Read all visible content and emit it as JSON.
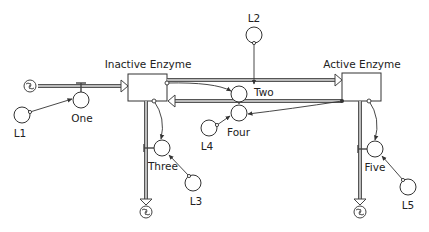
{
  "diagram": {
    "type": "stock-and-flow",
    "stocks": [
      {
        "id": "inactive",
        "label": "Inactive Enzyme"
      },
      {
        "id": "active",
        "label": "Active Enzyme"
      }
    ],
    "flows": [
      {
        "id": "one",
        "label": "One",
        "from": "source-cloud",
        "to": "inactive"
      },
      {
        "id": "two",
        "label": "Two",
        "from": "inactive",
        "to": "active"
      },
      {
        "id": "four",
        "label": "Four",
        "from": "active",
        "to": "inactive"
      },
      {
        "id": "three",
        "label": "Three",
        "from": "inactive",
        "to": "sink-cloud-1"
      },
      {
        "id": "five",
        "label": "Five",
        "from": "active",
        "to": "sink-cloud-2"
      }
    ],
    "converters": [
      {
        "id": "l1",
        "label": "L1",
        "links_to": "one"
      },
      {
        "id": "l2",
        "label": "L2",
        "links_to": "two"
      },
      {
        "id": "l3",
        "label": "L3",
        "links_to": "three"
      },
      {
        "id": "l4",
        "label": "L4",
        "links_to": "four"
      },
      {
        "id": "l5",
        "label": "L5",
        "links_to": "five"
      }
    ],
    "links": [
      {
        "from": "inactive",
        "to": "two"
      },
      {
        "from": "active",
        "to": "four"
      },
      {
        "from": "inactive",
        "to": "three"
      },
      {
        "from": "active",
        "to": "five"
      }
    ]
  },
  "labels": {
    "inactive_enzyme": "Inactive Enzyme",
    "active_enzyme": "Active Enzyme",
    "one": "One",
    "two": "Two",
    "three": "Three",
    "four": "Four",
    "five": "Five",
    "l1": "L1",
    "l2": "L2",
    "l3": "L3",
    "l4": "L4",
    "l5": "L5"
  }
}
